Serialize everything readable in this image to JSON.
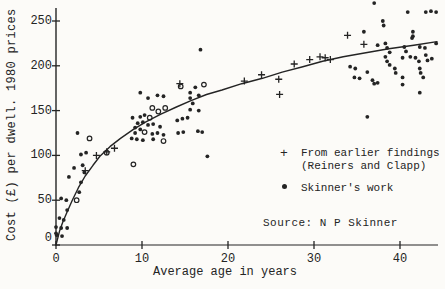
{
  "figure": {
    "ink_color": "#242424",
    "paper_color": "#fcfbf8"
  },
  "chart_data": {
    "type": "scatter",
    "title": "",
    "xlabel": "Average age in years",
    "ylabel": "Cost (£) per dwell. 1980 prices",
    "xlim": [
      0,
      45
    ],
    "ylim": [
      0,
      275
    ],
    "x_ticks": [
      0,
      10,
      20,
      30,
      40
    ],
    "y_ticks": [
      0,
      50,
      100,
      150,
      200,
      250
    ],
    "grid": false,
    "legend": {
      "position": "right-middle",
      "entries": [
        {
          "marker": "plus",
          "glyph": "+",
          "label_lines": [
            "From earlier findings",
            "(Reiners and Clapp)"
          ]
        },
        {
          "marker": "dot",
          "glyph": "",
          "label_lines": [
            "Skinner's work"
          ]
        }
      ]
    },
    "source_note": "Source: N P Skinner",
    "series": [
      {
        "name": "From earlier findings (Reiners and Clapp)",
        "marker": "plus",
        "points": [
          [
            3.4,
            83
          ],
          [
            4.7,
            100
          ],
          [
            5.9,
            104
          ],
          [
            6.8,
            108
          ],
          [
            14.4,
            180
          ],
          [
            21.9,
            183
          ],
          [
            23.9,
            190
          ],
          [
            25.9,
            185
          ],
          [
            26.0,
            168
          ],
          [
            27.7,
            202
          ],
          [
            29.5,
            207
          ],
          [
            30.7,
            210
          ],
          [
            31.3,
            209
          ],
          [
            31.9,
            207
          ],
          [
            33.9,
            234
          ],
          [
            35.8,
            224
          ]
        ]
      },
      {
        "name": "Skinner's work",
        "marker": "dot",
        "points": [
          [
            0.0,
            13
          ],
          [
            0.1,
            11
          ],
          [
            0.7,
            10
          ],
          [
            0.0,
            20
          ],
          [
            0.6,
            19
          ],
          [
            1.3,
            19
          ],
          [
            0.4,
            30
          ],
          [
            0.9,
            28
          ],
          [
            1.3,
            39
          ],
          [
            0.6,
            52
          ],
          [
            1.2,
            50
          ],
          [
            2.7,
            59
          ],
          [
            2.9,
            70
          ],
          [
            1.5,
            76
          ],
          [
            2.1,
            86
          ],
          [
            3.1,
            89
          ],
          [
            3.3,
            81
          ],
          [
            2.9,
            101
          ],
          [
            3.5,
            103
          ],
          [
            2.5,
            125
          ],
          [
            8.9,
            142
          ],
          [
            9.8,
            143
          ],
          [
            10.3,
            145
          ],
          [
            9.8,
            170
          ],
          [
            10.7,
            164
          ],
          [
            11.8,
            167
          ],
          [
            12.5,
            166
          ],
          [
            9.5,
            136
          ],
          [
            10.1,
            137
          ],
          [
            10.7,
            134
          ],
          [
            11.3,
            135
          ],
          [
            12.1,
            132
          ],
          [
            9.2,
            131
          ],
          [
            9.8,
            129
          ],
          [
            9.2,
            125
          ],
          [
            11.2,
            124
          ],
          [
            11.8,
            125
          ],
          [
            12.5,
            123
          ],
          [
            8.8,
            119
          ],
          [
            9.4,
            118
          ],
          [
            10.1,
            117
          ],
          [
            11.3,
            118
          ],
          [
            14.1,
            139
          ],
          [
            14.7,
            141
          ],
          [
            14.2,
            125
          ],
          [
            14.8,
            126
          ],
          [
            15.6,
            164
          ],
          [
            16.2,
            176
          ],
          [
            15.6,
            170
          ],
          [
            16.6,
            167
          ],
          [
            15.9,
            158
          ],
          [
            15.6,
            151
          ],
          [
            16.6,
            150
          ],
          [
            16.5,
            127
          ],
          [
            17.0,
            126
          ],
          [
            15.3,
            142
          ],
          [
            17.6,
            99
          ],
          [
            16.8,
            218
          ],
          [
            37.0,
            270
          ],
          [
            40.9,
            260
          ],
          [
            43.0,
            260
          ],
          [
            43.6,
            261
          ],
          [
            44.2,
            260
          ],
          [
            38.0,
            250
          ],
          [
            38.1,
            245
          ],
          [
            35.8,
            238
          ],
          [
            41.5,
            238
          ],
          [
            41.5,
            233
          ],
          [
            41.4,
            231
          ],
          [
            37.4,
            223
          ],
          [
            38.3,
            225
          ],
          [
            38.5,
            220
          ],
          [
            38.8,
            215
          ],
          [
            38.3,
            210
          ],
          [
            38.5,
            205
          ],
          [
            38.8,
            201
          ],
          [
            40.5,
            221
          ],
          [
            40.7,
            216
          ],
          [
            42.3,
            221
          ],
          [
            42.9,
            220
          ],
          [
            44.2,
            225
          ],
          [
            41.2,
            210
          ],
          [
            41.8,
            209
          ],
          [
            42.2,
            205
          ],
          [
            43.0,
            212
          ],
          [
            40.3,
            209
          ],
          [
            43.2,
            206
          ],
          [
            43.7,
            208
          ],
          [
            34.2,
            199
          ],
          [
            34.8,
            197
          ],
          [
            36.2,
            193
          ],
          [
            34.7,
            187
          ],
          [
            35.3,
            186
          ],
          [
            40.3,
            187
          ],
          [
            37.4,
            181
          ],
          [
            36.8,
            184
          ],
          [
            37.0,
            180
          ],
          [
            39.4,
            197
          ],
          [
            39.5,
            192
          ],
          [
            42.3,
            197
          ],
          [
            42.4,
            192
          ],
          [
            42.7,
            187
          ],
          [
            42.3,
            170
          ],
          [
            40.3,
            179
          ],
          [
            36.2,
            143
          ]
        ],
        "open_circle_points": [
          [
            2.4,
            50
          ],
          [
            3.9,
            119
          ],
          [
            5.9,
            103
          ],
          [
            10.9,
            142
          ],
          [
            11.2,
            153
          ],
          [
            11.9,
            149
          ],
          [
            12.7,
            153
          ],
          [
            10.3,
            126
          ],
          [
            12.5,
            116
          ],
          [
            17.2,
            179
          ],
          [
            14.5,
            177
          ],
          [
            9.0,
            90
          ]
        ]
      }
    ],
    "fit_curve": {
      "points": [
        [
          0,
          0
        ],
        [
          0.4,
          15
        ],
        [
          0.8,
          26
        ],
        [
          1.3,
          37
        ],
        [
          1.9,
          50
        ],
        [
          2.6,
          64
        ],
        [
          3.4,
          77
        ],
        [
          4.3,
          89
        ],
        [
          5.1,
          99
        ],
        [
          6.3,
          110
        ],
        [
          7.5,
          119
        ],
        [
          9.0,
          129
        ],
        [
          10.4,
          137
        ],
        [
          12.2,
          146
        ],
        [
          14.0,
          154
        ],
        [
          15.7,
          161
        ],
        [
          17.5,
          168
        ],
        [
          19.3,
          173
        ],
        [
          21.6,
          180
        ],
        [
          24.0,
          186
        ],
        [
          26.3,
          193
        ],
        [
          28.7,
          199
        ],
        [
          31.0,
          205
        ],
        [
          33.4,
          210
        ],
        [
          35.7,
          214
        ],
        [
          38.7,
          219
        ],
        [
          41.6,
          223
        ],
        [
          44.3,
          227
        ]
      ]
    }
  }
}
